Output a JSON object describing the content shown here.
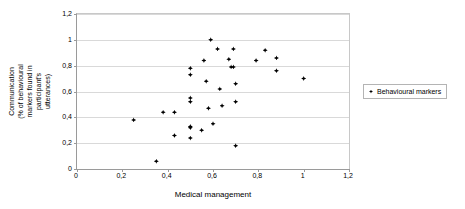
{
  "chart_data": {
    "type": "scatter",
    "title": "",
    "xlabel": "Medical management",
    "ylabel": "Communication (% of behavioural markers found in participant's utterances)",
    "xlim": [
      0,
      1.2
    ],
    "ylim": [
      0,
      1.2
    ],
    "xticks": [
      "0",
      "0,2",
      "0,4",
      "0,6",
      "0,8",
      "1",
      "1,2"
    ],
    "xtick_values": [
      0,
      0.2,
      0.4,
      0.6,
      0.8,
      1.0,
      1.2
    ],
    "yticks": [
      "0",
      "0,2",
      "0,4",
      "0,6",
      "0,8",
      "1",
      "1,2"
    ],
    "ytick_values": [
      0,
      0.2,
      0.4,
      0.6,
      0.8,
      1.0,
      1.2
    ],
    "grid": "horizontal",
    "legend_position": "right",
    "marker_color": "#000000",
    "series": [
      {
        "name": "Behavioural markers",
        "points": [
          [
            0.25,
            0.38
          ],
          [
            0.35,
            0.06
          ],
          [
            0.38,
            0.44
          ],
          [
            0.43,
            0.44
          ],
          [
            0.43,
            0.26
          ],
          [
            0.5,
            0.78
          ],
          [
            0.5,
            0.73
          ],
          [
            0.5,
            0.55
          ],
          [
            0.5,
            0.52
          ],
          [
            0.5,
            0.32
          ],
          [
            0.5,
            0.33
          ],
          [
            0.5,
            0.24
          ],
          [
            0.55,
            0.3
          ],
          [
            0.56,
            0.84
          ],
          [
            0.57,
            0.68
          ],
          [
            0.58,
            0.47
          ],
          [
            0.59,
            1.0
          ],
          [
            0.6,
            0.35
          ],
          [
            0.62,
            0.93
          ],
          [
            0.63,
            0.62
          ],
          [
            0.64,
            0.49
          ],
          [
            0.67,
            0.85
          ],
          [
            0.68,
            0.79
          ],
          [
            0.69,
            0.79
          ],
          [
            0.69,
            0.93
          ],
          [
            0.7,
            0.66
          ],
          [
            0.7,
            0.52
          ],
          [
            0.7,
            0.18
          ],
          [
            0.79,
            0.84
          ],
          [
            0.83,
            0.92
          ],
          [
            0.88,
            0.86
          ],
          [
            0.88,
            0.76
          ],
          [
            1.0,
            0.7
          ]
        ]
      }
    ]
  },
  "legend": {
    "entries": [
      {
        "label": "Behavioural markers",
        "marker": "diamond-marker"
      }
    ]
  },
  "axes": {
    "x_title": "Medical management",
    "y_title": "Communication (% of behavioural markers found in participant's utterances)"
  }
}
